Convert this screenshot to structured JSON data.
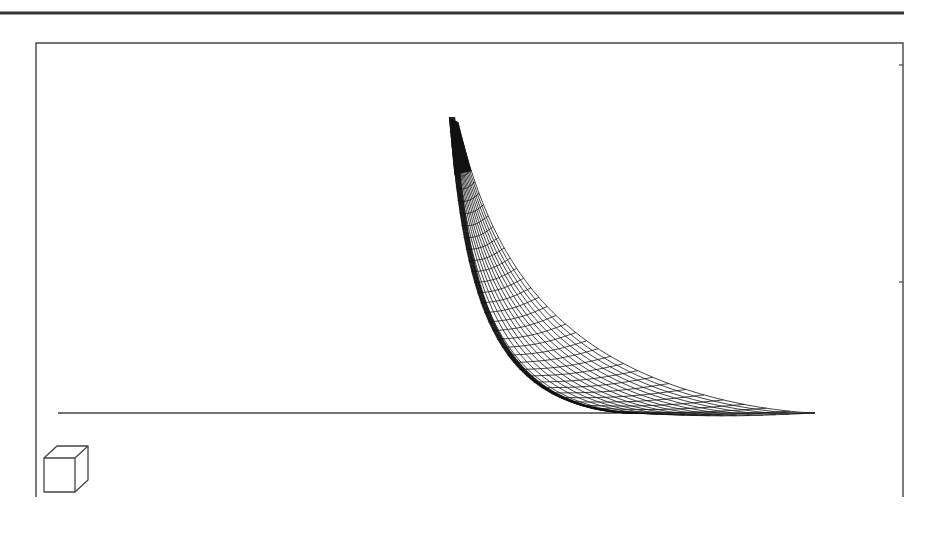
{
  "figure": {
    "kind": "3d-wireframe-surface-plot",
    "background": "#ffffff",
    "ink_color": "#1a1a1a",
    "top_rule": {
      "x1": 0,
      "x2": 904,
      "y": 13,
      "width": 3,
      "color": "#333333"
    },
    "frame": {
      "left": 36,
      "top": 43,
      "right": 903,
      "bottom": 497,
      "stroke": "#444444",
      "stroke_width": 1.4
    },
    "right_ticks": [
      65,
      282
    ],
    "baseline": {
      "x1": 58,
      "x2": 815,
      "y": 413,
      "color": "#444444"
    },
    "surface": {
      "apex": [
        449,
        117
      ],
      "apex_right": [
        458,
        122
      ],
      "left_foot": [
        632,
        413
      ],
      "right_foot": [
        815,
        413
      ],
      "rows": 34,
      "cols": 14,
      "curvature_left": 2.6,
      "curvature_right": 2.2,
      "line_color": "#111111",
      "line_width": 0.8
    },
    "orientation_cube": {
      "front": {
        "x": 44,
        "y": 458,
        "w": 31,
        "h": 34
      },
      "depth_dx": 13,
      "depth_dy": -12,
      "stroke": "#444444"
    }
  }
}
